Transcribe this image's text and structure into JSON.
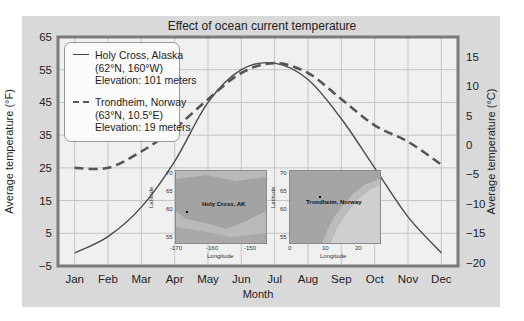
{
  "chart_data": {
    "type": "line",
    "title": "Effect of ocean current temperature",
    "xlabel": "Month",
    "ylabel": "Average temperature (°F)",
    "ylabel_right": "Average temperature (°C)",
    "categories": [
      "Jan",
      "Feb",
      "Mar",
      "Apr",
      "May",
      "Jun",
      "Jul",
      "Aug",
      "Sep",
      "Oct",
      "Nov",
      "Dec"
    ],
    "ylim": [
      -5,
      65
    ],
    "yticks": [
      -5,
      5,
      15,
      25,
      35,
      45,
      55,
      65
    ],
    "ylim_right": [
      -20.6,
      18.3
    ],
    "yticks_right": [
      -20,
      -15,
      -10,
      -5,
      0,
      5,
      10,
      15
    ],
    "grid": true,
    "legend_position": "upper-left",
    "series": [
      {
        "name": "Holy Cross, Alaska",
        "detail": [
          "(62°N, 160°W)",
          "Elevation: 101 meters"
        ],
        "style": "solid",
        "values": [
          -1,
          4,
          13,
          27,
          45,
          55,
          57,
          52,
          40,
          25,
          10,
          -1
        ]
      },
      {
        "name": "Trondheim, Norway",
        "detail": [
          "(63°N, 10.5°E)",
          "Elevation: 19 meters"
        ],
        "style": "dashed",
        "values": [
          25,
          25,
          30,
          37,
          46,
          54,
          57,
          54,
          46,
          38,
          33,
          26
        ]
      }
    ],
    "insets": [
      {
        "label": "Holy Cross, AK",
        "xlabel": "Longitude",
        "ylabel": "Latitude",
        "xticks": [
          "-170",
          "-160",
          "-150"
        ],
        "yticks": [
          "70",
          "65",
          "60",
          "55"
        ]
      },
      {
        "label": "Trondheim, Norway",
        "xlabel": "Longitude",
        "ylabel": "Latitude",
        "xticks": [
          "0",
          "10",
          "20"
        ],
        "yticks": [
          "70",
          "65",
          "60",
          "55"
        ]
      }
    ]
  },
  "legend": {
    "items": [
      {
        "line1": "Holy Cross, Alaska",
        "line2": "(62°N, 160°W)",
        "line3": "Elevation: 101 meters"
      },
      {
        "line1": "Trondheim, Norway",
        "line2": "(63°N, 10.5°E)",
        "line3": "Elevation: 19 meters"
      }
    ]
  },
  "colors": {
    "frame": "#d9d9d9",
    "plot_bg": "#f0f0f0",
    "plot_border": "#7a7a7a",
    "grid": "#c4c4c4",
    "line": "#4a4a4a"
  }
}
